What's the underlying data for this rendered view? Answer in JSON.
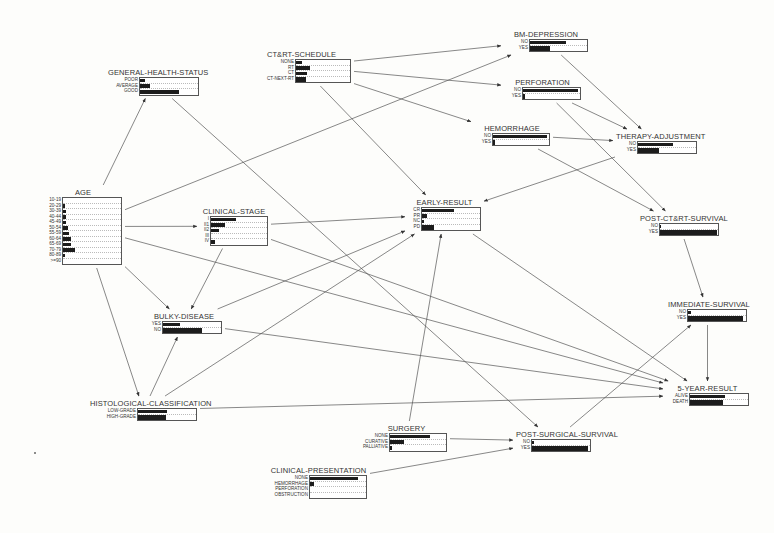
{
  "diagram": {
    "type": "bayesian-network",
    "nodes": {
      "age": {
        "title": "AGE",
        "states": [
          "10-19",
          "20-29",
          "30-39",
          "40-44",
          "45-49",
          "50-54",
          "55-59",
          "60-64",
          "65-69",
          "70-79",
          "80-89",
          ">=90"
        ],
        "probs": [
          0,
          3,
          5,
          5,
          5,
          9,
          11,
          14,
          14,
          20,
          3,
          0
        ]
      },
      "general_health_status": {
        "title": "GENERAL-HEALTH-STATUS",
        "states": [
          "POOR",
          "AVERAGE",
          "GOOD"
        ],
        "probs": [
          8,
          18,
          68
        ]
      },
      "ctrt_schedule": {
        "title": "CT&RT-SCHEDULE",
        "states": [
          "NONE",
          "RT",
          "CT",
          "CT-NEXT-RT"
        ],
        "probs": [
          12,
          26,
          20,
          18
        ]
      },
      "bm_depression": {
        "title": "BM-DEPRESSION",
        "states": [
          "NO",
          "YES"
        ],
        "probs": [
          63,
          35
        ]
      },
      "perforation": {
        "title": "PERFORATION",
        "states": [
          "NO",
          "YES"
        ],
        "probs": [
          97,
          3
        ]
      },
      "hemorrhage": {
        "title": "HEMORRHAGE",
        "states": [
          "NO",
          "YES"
        ],
        "probs": [
          96,
          4
        ]
      },
      "therapy_adjustment": {
        "title": "THERAPY-ADJUSTMENT",
        "states": [
          "NO",
          "YES"
        ],
        "probs": [
          61,
          36
        ]
      },
      "early_result": {
        "title": "EARLY-RESULT",
        "states": [
          "CR",
          "PR",
          "NC",
          "PD"
        ],
        "probs": [
          55,
          8,
          4,
          21
        ]
      },
      "clinical_stage": {
        "title": "CLINICAL-STAGE",
        "states": [
          "I",
          "II1",
          "II2",
          "III",
          "IV"
        ],
        "probs": [
          45,
          25,
          15,
          0,
          8
        ]
      },
      "post_ctrt_survival": {
        "title": "POST-CT&RT-SURVIVAL",
        "states": [
          "NO",
          "YES"
        ],
        "probs": [
          1,
          99
        ]
      },
      "immediate_survival": {
        "title": "IMMEDIATE-SURVIVAL",
        "states": [
          "NO",
          "YES"
        ],
        "probs": [
          5,
          95
        ]
      },
      "bulky_disease": {
        "title": "BULKY-DISEASE",
        "states": [
          "YES",
          "NO"
        ],
        "probs": [
          30,
          68
        ]
      },
      "histological_classification": {
        "title": "HISTOLOGICAL-CLASSIFICATION",
        "states": [
          "LOW-GRADE",
          "HIGH-GRADE"
        ],
        "probs": [
          50,
          48
        ]
      },
      "five_year_result": {
        "title": "5-YEAR-RESULT",
        "states": [
          "ALIVE",
          "DEATH"
        ],
        "probs": [
          60,
          57
        ]
      },
      "surgery": {
        "title": "SURGERY",
        "states": [
          "NONE",
          "CURATIVE",
          "PALLIATIVE"
        ],
        "probs": [
          72,
          25,
          3
        ]
      },
      "post_surgical_survival": {
        "title": "POST-SURGICAL-SURVIVAL",
        "states": [
          "NO",
          "YES"
        ],
        "probs": [
          3,
          97
        ]
      },
      "clinical_presentation": {
        "title": "CLINICAL-PRESENTATION",
        "states": [
          "NONE",
          "HEMORRHAGE",
          "PERFORATION",
          "OBSTRUCTION"
        ],
        "probs": [
          85,
          8,
          0,
          0
        ]
      }
    },
    "edges": [
      [
        "age",
        "general_health_status"
      ],
      [
        "age",
        "bm_depression"
      ],
      [
        "age",
        "clinical_stage"
      ],
      [
        "age",
        "bulky_disease"
      ],
      [
        "age",
        "histological_classification"
      ],
      [
        "age",
        "five_year_result"
      ],
      [
        "general_health_status",
        "post_surgical_survival"
      ],
      [
        "ctrt_schedule",
        "bm_depression"
      ],
      [
        "ctrt_schedule",
        "perforation"
      ],
      [
        "ctrt_schedule",
        "hemorrhage"
      ],
      [
        "ctrt_schedule",
        "early_result"
      ],
      [
        "bm_depression",
        "therapy_adjustment"
      ],
      [
        "perforation",
        "therapy_adjustment"
      ],
      [
        "perforation",
        "post_ctrt_survival"
      ],
      [
        "hemorrhage",
        "therapy_adjustment"
      ],
      [
        "hemorrhage",
        "post_ctrt_survival"
      ],
      [
        "therapy_adjustment",
        "early_result"
      ],
      [
        "clinical_stage",
        "early_result"
      ],
      [
        "clinical_stage",
        "bulky_disease"
      ],
      [
        "clinical_stage",
        "five_year_result"
      ],
      [
        "bulky_disease",
        "early_result"
      ],
      [
        "bulky_disease",
        "five_year_result"
      ],
      [
        "histological_classification",
        "bulky_disease"
      ],
      [
        "histological_classification",
        "early_result"
      ],
      [
        "histological_classification",
        "five_year_result"
      ],
      [
        "early_result",
        "five_year_result"
      ],
      [
        "post_ctrt_survival",
        "immediate_survival"
      ],
      [
        "immediate_survival",
        "five_year_result"
      ],
      [
        "surgery",
        "early_result"
      ],
      [
        "surgery",
        "post_surgical_survival"
      ],
      [
        "post_surgical_survival",
        "immediate_survival"
      ],
      [
        "clinical_presentation",
        "post_surgical_survival"
      ]
    ]
  },
  "colors": {
    "bar_fill": "#1c1c1c",
    "line": "#444444",
    "background": "#fdfdfb"
  }
}
